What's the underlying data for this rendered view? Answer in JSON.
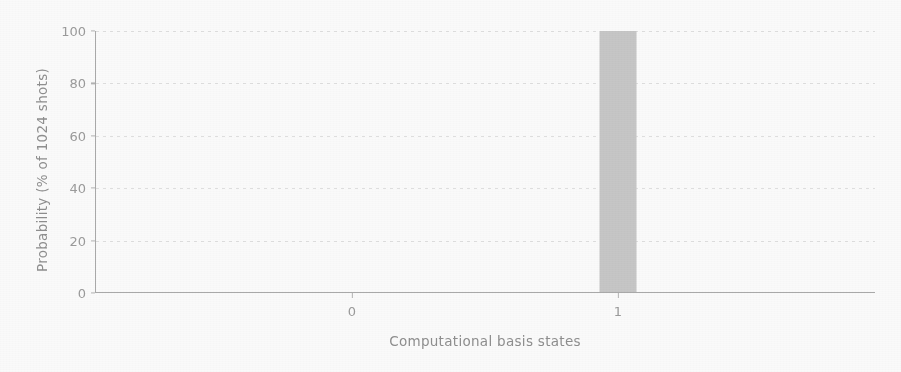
{
  "chart_data": {
    "type": "bar",
    "title": "",
    "subtitle": "",
    "xlabel": "Computational basis states",
    "ylabel": "Probability (% of 1024 shots)",
    "categories": [
      "0",
      "1"
    ],
    "values": [
      0,
      100
    ],
    "series": [
      {
        "name": "Probability",
        "values": [
          0,
          100
        ]
      }
    ],
    "ylim": [
      0,
      100
    ],
    "yticks": [
      "0",
      "20",
      "40",
      "60",
      "80",
      "100"
    ],
    "ytick_values": [
      0,
      20,
      40,
      60,
      80,
      100
    ],
    "xticks": [
      "0",
      "1"
    ],
    "grid": "horizontal-dotted",
    "legend": "none",
    "bar_color": "#c8c8c8",
    "axis_color": "#a9a9a9",
    "text_color": "#9a9a9a",
    "background_color": "#ffffff",
    "annotations": []
  }
}
